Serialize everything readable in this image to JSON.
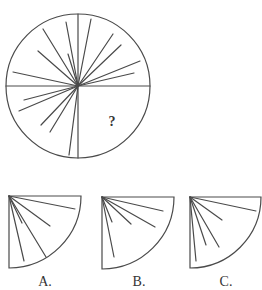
{
  "puzzle": {
    "question_mark": "?",
    "stroke_color": "#4a4a4a",
    "circle": {
      "cx": 78,
      "cy": 86,
      "r": 72,
      "dividers": [
        {
          "x1": 6,
          "y1": 86,
          "x2": 150,
          "y2": 86
        },
        {
          "x1": 78,
          "y1": 14,
          "x2": 78,
          "y2": 158
        }
      ],
      "rays": [
        {
          "x": 66,
          "y": 22
        },
        {
          "x": 43,
          "y": 29
        },
        {
          "x": 38,
          "y": 51
        },
        {
          "x": 13,
          "y": 72
        },
        {
          "x": 68,
          "y": 54
        },
        {
          "x": 91,
          "y": 19
        },
        {
          "x": 113,
          "y": 34
        },
        {
          "x": 121,
          "y": 45
        },
        {
          "x": 140,
          "y": 61
        },
        {
          "x": 134,
          "y": 73
        },
        {
          "x": 24,
          "y": 100
        },
        {
          "x": 19,
          "y": 111
        },
        {
          "x": 41,
          "y": 125
        },
        {
          "x": 50,
          "y": 132
        },
        {
          "x": 69,
          "y": 155
        }
      ],
      "question_mark_pos": {
        "x": 112,
        "y": 126
      }
    },
    "options": [
      {
        "label": "A.",
        "corner": {
          "x": 9,
          "y": 196
        },
        "r": 72,
        "label_pos": {
          "x": 45,
          "y": 286
        },
        "rays": [
          {
            "x": 75,
            "y": 209
          },
          {
            "x": 50,
            "y": 226
          },
          {
            "x": 46,
            "y": 257
          },
          {
            "x": 22,
            "y": 223
          },
          {
            "x": 24,
            "y": 261
          }
        ]
      },
      {
        "label": "B.",
        "corner": {
          "x": 102,
          "y": 197
        },
        "r": 72,
        "label_pos": {
          "x": 139,
          "y": 286
        },
        "rays": [
          {
            "x": 163,
            "y": 211
          },
          {
            "x": 155,
            "y": 227
          },
          {
            "x": 131,
            "y": 224
          },
          {
            "x": 112,
            "y": 222
          },
          {
            "x": 114,
            "y": 257
          }
        ]
      },
      {
        "label": "C.",
        "corner": {
          "x": 190,
          "y": 197
        },
        "r": 71,
        "label_pos": {
          "x": 226,
          "y": 286
        },
        "rays": [
          {
            "x": 256,
            "y": 211
          },
          {
            "x": 222,
            "y": 220
          },
          {
            "x": 219,
            "y": 247
          },
          {
            "x": 206,
            "y": 245
          },
          {
            "x": 196,
            "y": 261
          }
        ]
      }
    ]
  }
}
